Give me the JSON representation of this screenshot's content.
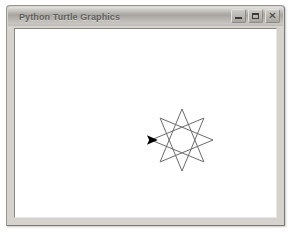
{
  "window": {
    "title": "Python Turtle Graphics",
    "controls": [
      {
        "name": "minimize",
        "label": "–"
      },
      {
        "name": "maximize",
        "label": "□"
      },
      {
        "name": "close",
        "label": "✕"
      }
    ],
    "frame_color": "#d6d3ce",
    "titlebar_color": "#b4b1ac",
    "canvas_background": "#ffffff"
  },
  "drawing": {
    "type": "star-polygon",
    "schlafli": "{8/3}",
    "points": 8,
    "step": 3,
    "line_color": "#6b6b6b",
    "line_width": 1,
    "center_x": 181,
    "center_y": 139,
    "radius": 31,
    "start_angle_deg": 180,
    "turtle": {
      "shape": "arrow",
      "color": "#000000",
      "x": 150,
      "y": 139,
      "heading_deg": 0,
      "size": 9
    }
  }
}
